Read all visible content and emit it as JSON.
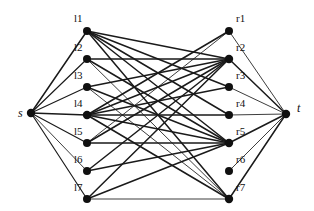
{
  "figure": {
    "type": "bipartite-flow-network-diagram",
    "background_color": "#ffffff",
    "edge_color": "#1a1a1a",
    "node_color": "#101010",
    "label_color": "#111111",
    "width": 314,
    "height": 211
  },
  "nodes": {
    "source": {
      "id": "s",
      "label": "s",
      "x": 31,
      "y": 113,
      "r": 4.2,
      "label_x": 18,
      "label_y": 117
    },
    "sink": {
      "id": "t",
      "label": "t",
      "x": 286,
      "y": 114,
      "r": 4.2,
      "label_x": 297,
      "label_y": 112
    },
    "left": [
      {
        "id": "l1",
        "label": "l1",
        "x": 87,
        "y": 31,
        "r": 4.0,
        "label_x": 74,
        "label_y": 22
      },
      {
        "id": "l2",
        "label": "l2",
        "x": 87,
        "y": 59,
        "r": 4.0,
        "label_x": 74,
        "label_y": 51
      },
      {
        "id": "l3",
        "label": "l3",
        "x": 87,
        "y": 87,
        "r": 4.0,
        "label_x": 74,
        "label_y": 79
      },
      {
        "id": "l4",
        "label": "l4",
        "x": 87,
        "y": 115,
        "r": 4.2,
        "label_x": 74,
        "label_y": 107
      },
      {
        "id": "l5",
        "label": "l5",
        "x": 87,
        "y": 143,
        "r": 4.0,
        "label_x": 74,
        "label_y": 135
      },
      {
        "id": "l6",
        "label": "l6",
        "x": 87,
        "y": 171,
        "r": 4.0,
        "label_x": 74,
        "label_y": 163
      },
      {
        "id": "l7",
        "label": "l7",
        "x": 87,
        "y": 199,
        "r": 4.0,
        "label_x": 74,
        "label_y": 191
      }
    ],
    "right": [
      {
        "id": "r1",
        "label": "r1",
        "x": 229,
        "y": 31,
        "r": 4.0,
        "label_x": 236,
        "label_y": 22
      },
      {
        "id": "r2",
        "label": "r2",
        "x": 229,
        "y": 59,
        "r": 4.2,
        "label_x": 236,
        "label_y": 51
      },
      {
        "id": "r3",
        "label": "r3",
        "x": 229,
        "y": 87,
        "r": 4.0,
        "label_x": 236,
        "label_y": 79
      },
      {
        "id": "r4",
        "label": "r4",
        "x": 229,
        "y": 115,
        "r": 4.0,
        "label_x": 236,
        "label_y": 107
      },
      {
        "id": "r5",
        "label": "r5",
        "x": 229,
        "y": 143,
        "r": 4.2,
        "label_x": 236,
        "label_y": 135
      },
      {
        "id": "r6",
        "label": "r6",
        "x": 229,
        "y": 171,
        "r": 4.0,
        "label_x": 236,
        "label_y": 163
      },
      {
        "id": "r7",
        "label": "r7",
        "x": 229,
        "y": 199,
        "r": 4.2,
        "label_x": 236,
        "label_y": 191
      }
    ]
  },
  "edges": {
    "source_edges": [
      {
        "from": "s",
        "to": "l1"
      },
      {
        "from": "s",
        "to": "l2"
      },
      {
        "from": "s",
        "to": "l3"
      },
      {
        "from": "s",
        "to": "l4"
      },
      {
        "from": "s",
        "to": "l5"
      },
      {
        "from": "s",
        "to": "l6"
      },
      {
        "from": "s",
        "to": "l7"
      }
    ],
    "middle_edges": [
      {
        "from": "l1",
        "to": "r2"
      },
      {
        "from": "l1",
        "to": "r3"
      },
      {
        "from": "l1",
        "to": "r4"
      },
      {
        "from": "l1",
        "to": "r5"
      },
      {
        "from": "l1",
        "to": "r7"
      },
      {
        "from": "l2",
        "to": "r2"
      },
      {
        "from": "l2",
        "to": "r5"
      },
      {
        "from": "l2",
        "to": "r7"
      },
      {
        "from": "l3",
        "to": "r2"
      },
      {
        "from": "l3",
        "to": "r5"
      },
      {
        "from": "l3",
        "to": "r7"
      },
      {
        "from": "l4",
        "to": "r1"
      },
      {
        "from": "l4",
        "to": "r2"
      },
      {
        "from": "l4",
        "to": "r3"
      },
      {
        "from": "l4",
        "to": "r4"
      },
      {
        "from": "l4",
        "to": "r5"
      },
      {
        "from": "l4",
        "to": "r7"
      },
      {
        "from": "l5",
        "to": "r1"
      },
      {
        "from": "l5",
        "to": "r2"
      },
      {
        "from": "l5",
        "to": "r5"
      },
      {
        "from": "l6",
        "to": "r2"
      },
      {
        "from": "l6",
        "to": "r5"
      },
      {
        "from": "l7",
        "to": "r2"
      },
      {
        "from": "l7",
        "to": "r5"
      },
      {
        "from": "l7",
        "to": "r7"
      }
    ],
    "sink_edges": [
      {
        "from": "r1",
        "to": "t"
      },
      {
        "from": "r2",
        "to": "t"
      },
      {
        "from": "r3",
        "to": "t"
      },
      {
        "from": "r4",
        "to": "t"
      },
      {
        "from": "r5",
        "to": "t"
      },
      {
        "from": "r6",
        "to": "t"
      },
      {
        "from": "r7",
        "to": "t"
      }
    ]
  },
  "stroke": {
    "thin": 0.85,
    "thick": 1.5
  }
}
